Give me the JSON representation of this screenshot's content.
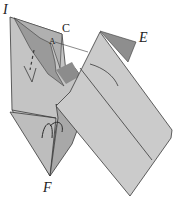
{
  "diagram": {
    "type": "origami-fold-illustration",
    "labels": {
      "I": "I",
      "C": "C",
      "A": "A",
      "E": "E",
      "F": "F"
    },
    "colors": {
      "paper_light": "#c8c8c8",
      "paper_mid": "#b4b4b4",
      "paper_dark": "#8a8a8a",
      "line": "#3a3a3a",
      "background": "#ffffff"
    }
  }
}
